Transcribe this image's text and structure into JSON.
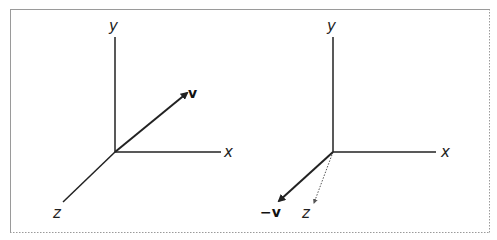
{
  "figure": {
    "border_color": "#9a9a9a",
    "panels": [
      {
        "name": "vector-v",
        "axes": {
          "x_label": "x",
          "y_label": "y",
          "z_label": "z"
        },
        "vector_label": "v",
        "z_axis_style": "solid"
      },
      {
        "name": "vector-negative-v",
        "axes": {
          "x_label": "x",
          "y_label": "y",
          "z_label": "z"
        },
        "vector_label": "−v",
        "z_axis_style": "dotted"
      }
    ]
  }
}
